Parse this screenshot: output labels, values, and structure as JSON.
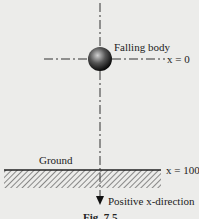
{
  "diagram": {
    "body_label": "Falling body",
    "start_label": "x = 0",
    "ground_label": "Ground",
    "ground_position_label": "x = 100",
    "direction_label": "Positive x-direction",
    "caption": "Fig. 7.5"
  },
  "colors": {
    "background": "#ececea",
    "line": "#333333",
    "ball_dark": "#111111",
    "ball_light": "#bbbbbb"
  }
}
